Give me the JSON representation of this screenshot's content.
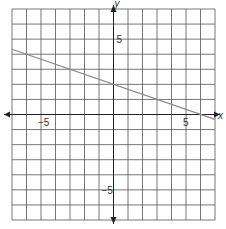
{
  "chart_data": {
    "type": "line",
    "title": "",
    "xlabel": "x",
    "ylabel": "y",
    "xlim": [
      -7,
      7
    ],
    "ylim": [
      -7,
      7
    ],
    "grid": true,
    "grid_step": 1,
    "tick_labels": {
      "x": [
        {
          "value": -5,
          "label": "−5"
        },
        {
          "value": 5,
          "label": "5"
        }
      ],
      "y": [
        {
          "value": 5,
          "label": "5"
        },
        {
          "value": -5,
          "label": "−5"
        }
      ]
    },
    "series": [
      {
        "name": "line",
        "equation": "y = -x/3 + 2",
        "slope": -0.3333,
        "intercept": 2,
        "x": [
          -7,
          7
        ],
        "y": [
          4.33,
          -0.33
        ],
        "color": "#8a8a8a"
      }
    ]
  },
  "colors": {
    "grid": "#555555",
    "axis": "#222222",
    "line": "#8a8a8a"
  }
}
